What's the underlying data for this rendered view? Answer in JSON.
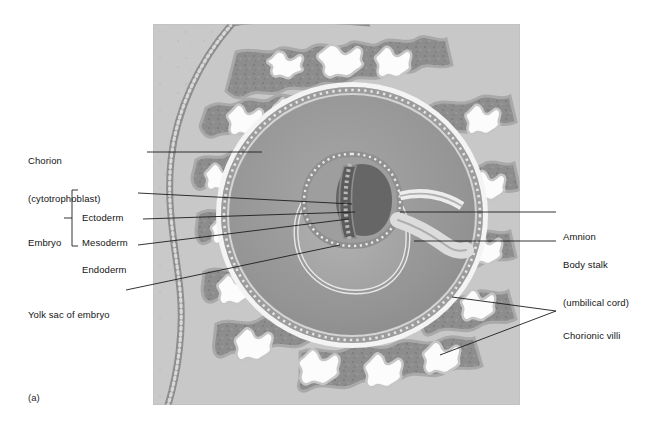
{
  "figure": {
    "panel_label": "(a)",
    "background_color": "#ffffff",
    "plate_color": "#c9c9c9"
  },
  "palette": {
    "plate_bg": "#c9c9c9",
    "extraembryonic_mesoderm": "#cfcfcf",
    "villi_dark": "#8d8d8d",
    "villi_mid": "#b0b0b0",
    "lacuna_white": "#fdfdfd",
    "trophoblast_line": "#8a8a8a",
    "chorionic_cavity": "#9b9b9b",
    "yolk_sac_cavity": "#a8a8a8",
    "amniotic_cavity": "#6f6f6f",
    "epithelium_light": "#e6e6e6",
    "disc_dark": "#5d5d5d",
    "leader_line": "#1d1d1d"
  },
  "labels": {
    "left": [
      {
        "name": "chorion",
        "lines": [
          "Chorion",
          "(cytotrophoblast)"
        ],
        "x": 28,
        "y": 130,
        "leader_from": [
          147,
          152
        ],
        "leader_to": [
          262,
          152
        ]
      },
      {
        "name": "ectoderm",
        "lines": [
          "Ectoderm"
        ],
        "x": 85,
        "y": 187,
        "leader_from": [
          138,
          193
        ],
        "leader_to": [
          352,
          204
        ]
      },
      {
        "name": "mesoderm",
        "lines": [
          "Mesoderm"
        ],
        "x": 85,
        "y": 213,
        "leader_from": [
          143,
          219
        ],
        "leader_to": [
          355,
          212
        ]
      },
      {
        "name": "endoderm",
        "lines": [
          "Endoderm"
        ],
        "x": 85,
        "y": 239,
        "leader_from": [
          138,
          245
        ],
        "leader_to": [
          349,
          219
        ]
      },
      {
        "name": "embryo",
        "lines": [
          "Embryo"
        ],
        "x": 28,
        "y": 213,
        "bracket": {
          "x": 72,
          "top": 192,
          "bottom": 244,
          "stub_x": 65,
          "stub_y": 218
        }
      },
      {
        "name": "yolk-sac-of-embryo",
        "lines": [
          "Yolk sac of embryo"
        ],
        "x": 28,
        "y": 285,
        "leader_from": [
          126,
          290
        ],
        "leader_to": [
          340,
          245
        ]
      }
    ],
    "right": [
      {
        "name": "amnion",
        "lines": [
          "Amnion"
        ],
        "x": 563,
        "y": 206,
        "leader_from": [
          556,
          212
        ],
        "leader_to": [
          400,
          212
        ]
      },
      {
        "name": "body-stalk",
        "lines": [
          "Body stalk",
          "(umbilical cord)"
        ],
        "x": 563,
        "y": 234,
        "leader_from": [
          556,
          241
        ],
        "leader_to": [
          414,
          241
        ]
      },
      {
        "name": "chorionic-villi",
        "lines": [
          "Chorionic villi"
        ],
        "x": 563,
        "y": 305,
        "leader_from": [
          556,
          311
        ],
        "leader_to_a": [
          452,
          297
        ],
        "leader_to_b": [
          440,
          355
        ]
      }
    ]
  }
}
